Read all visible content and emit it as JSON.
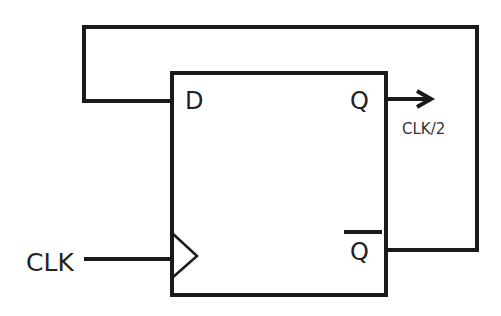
{
  "diagram": {
    "type": "d-flip-flop-frequency-divider",
    "component": {
      "name": "D flip-flop",
      "pins": {
        "d": "D",
        "q": "Q",
        "q_bar": "Q",
        "clock_symbol": "clock-edge-triangle"
      }
    },
    "labels": {
      "clock_input": "CLK",
      "output": "CLK/2"
    },
    "connections": [
      {
        "from": "CLK",
        "to": "clock-input"
      },
      {
        "from": "Q",
        "to": "output CLK/2"
      },
      {
        "from": "Q-bar",
        "to": "D",
        "note": "feedback loop"
      }
    ],
    "colors": {
      "line": "#1a1a1a",
      "background": "#ffffff"
    }
  }
}
